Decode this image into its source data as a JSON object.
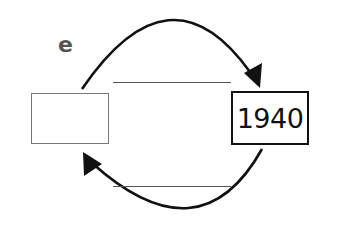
{
  "diagram": {
    "label": "e",
    "left_box": {
      "text": ""
    },
    "right_box": {
      "text": "1940"
    },
    "top_blank_line": "",
    "bottom_blank_line": "",
    "arrows": [
      {
        "from": "left_box",
        "to": "right_box",
        "direction": "clockwise-top"
      },
      {
        "from": "right_box",
        "to": "left_box",
        "direction": "clockwise-bottom"
      }
    ],
    "colors": {
      "stroke": "#111111",
      "label": "#555555",
      "box_left_border": "#777777",
      "line": "#555555"
    }
  }
}
